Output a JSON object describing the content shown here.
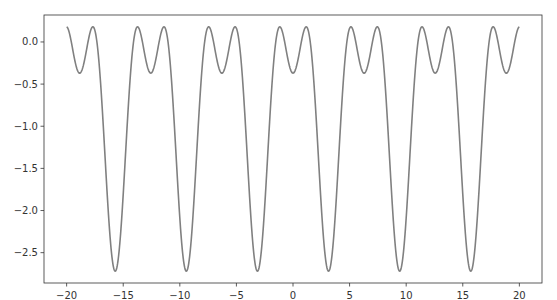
{
  "chart_data": {
    "type": "line",
    "title": "",
    "xlabel": "",
    "ylabel": "",
    "xlim": [
      -22,
      22
    ],
    "ylim": [
      -2.86,
      0.32
    ],
    "grid": false,
    "legend": null,
    "x_ticks": [
      -20,
      -15,
      -10,
      -5,
      0,
      5,
      10,
      15,
      20
    ],
    "x_tick_labels": [
      "−20",
      "−15",
      "−10",
      "−5",
      "0",
      "5",
      "10",
      "15",
      "20"
    ],
    "y_ticks": [
      0.0,
      -0.5,
      -1.0,
      -1.5,
      -2.0,
      -2.5
    ],
    "y_tick_labels": [
      "0.0",
      "−0.5",
      "−1.0",
      "−1.5",
      "−2.0",
      "−2.5"
    ],
    "series": [
      {
        "name": "f(x)",
        "color": "#808080",
        "x_range": [
          -20,
          20
        ],
        "approx_formula": "1.175*cos(x) - 0.747*cos(2x) - 0.798",
        "coefficients": {
          "a_cos_x": 1.175,
          "b_cos_2x": -0.747,
          "c": -0.798
        },
        "key_points": {
          "peak_value": 0.18,
          "shallow_min_value": -0.37,
          "deep_min_value": -2.72,
          "deep_min_x": [
            -15.7,
            -9.4,
            -3.1,
            3.1,
            9.4,
            15.7
          ],
          "shallow_min_x": [
            -18.8,
            -12.6,
            -6.3,
            0,
            6.3,
            12.6,
            18.8
          ]
        }
      }
    ]
  },
  "plot_area": {
    "left": 44,
    "top": 15,
    "right": 542,
    "bottom": 283
  },
  "colors": {
    "axis": "#333333",
    "line": "#808080",
    "background": "#ffffff"
  }
}
